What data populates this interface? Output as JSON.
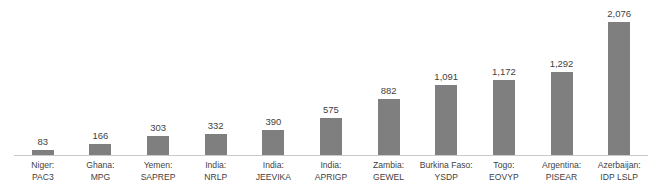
{
  "chart_data": {
    "type": "bar",
    "title": "",
    "title_clipped": true,
    "xlabel": "",
    "ylabel": "",
    "ylim": [
      0,
      2076
    ],
    "grid": false,
    "legend": false,
    "orientation": "vertical",
    "bar_color": "#7f7f7f",
    "categories": [
      "Niger: PAC3",
      "Ghana: MPG",
      "Yemen: SAPREP",
      "India: NRLP",
      "India: JEEVIKA",
      "India: APRIGP",
      "Zambia: GEWEL",
      "Burkina Faso: YSDP",
      "Togo: EOVYP",
      "Argentina: PISEAR",
      "Azerbaijan: IDP LSLP"
    ],
    "values": [
      83,
      166,
      303,
      332,
      390,
      575,
      882,
      1091,
      1172,
      1292,
      2076
    ],
    "value_labels": [
      "83",
      "166",
      "303",
      "332",
      "390",
      "575",
      "882",
      "1,091",
      "1,172",
      "1,292",
      "2,076"
    ],
    "category_lines": [
      {
        "line1": "Niger:",
        "line2": "PAC3"
      },
      {
        "line1": "Ghana:",
        "line2": "MPG"
      },
      {
        "line1": "Yemen:",
        "line2": "SAPREP"
      },
      {
        "line1": "India:",
        "line2": "NRLP"
      },
      {
        "line1": "India:",
        "line2": "JEEVIKA"
      },
      {
        "line1": "India:",
        "line2": "APRIGP"
      },
      {
        "line1": "Zambia:",
        "line2": "GEWEL"
      },
      {
        "line1": "Burkina Faso:",
        "line2": "YSDP"
      },
      {
        "line1": "Togo:",
        "line2": "EOVYP"
      },
      {
        "line1": "Argentina:",
        "line2": "PISEAR"
      },
      {
        "line1": "Azerbaijan:",
        "line2": "IDP LSLP"
      }
    ]
  },
  "colors": {
    "bar": "#7f7f7f",
    "text": "#3f3f3f",
    "axis": "#c9c9c9",
    "background": "#ffffff"
  }
}
